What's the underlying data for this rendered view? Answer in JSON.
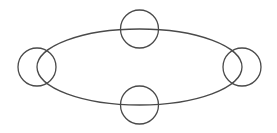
{
  "canvas": {
    "width": 277,
    "height": 133,
    "background": "#ffffff"
  },
  "style": {
    "stroke": "#4a4a4a",
    "stroke_width": 1.3
  },
  "ellipse": {
    "cx": 139.5,
    "cy": 67,
    "rx": 102.5,
    "ry": 38
  },
  "circles": [
    {
      "name": "top-node",
      "cx": 139.5,
      "cy": 29,
      "r": 19
    },
    {
      "name": "bottom-node",
      "cx": 139.5,
      "cy": 105,
      "r": 19
    },
    {
      "name": "left-node",
      "cx": 37,
      "cy": 67,
      "r": 19
    },
    {
      "name": "right-node",
      "cx": 242,
      "cy": 67,
      "r": 19
    }
  ]
}
